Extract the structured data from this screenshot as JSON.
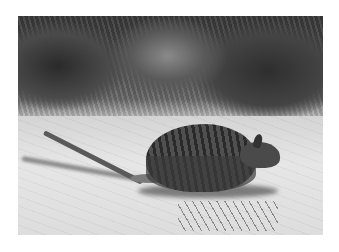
{
  "image": {
    "description": "Black-and-white photograph of a banded hare-wallaby (small striped marsupial) moving across sandy ground with grass tussocks and low shrubs behind it",
    "style": "grayscale photograph with white border",
    "subject": "banded hare-wallaby",
    "colors": {
      "border": "#ffffff",
      "sand": "#e0e0e0",
      "vegetation": "#3a3a3a",
      "animal": "#3a3a3a"
    }
  }
}
